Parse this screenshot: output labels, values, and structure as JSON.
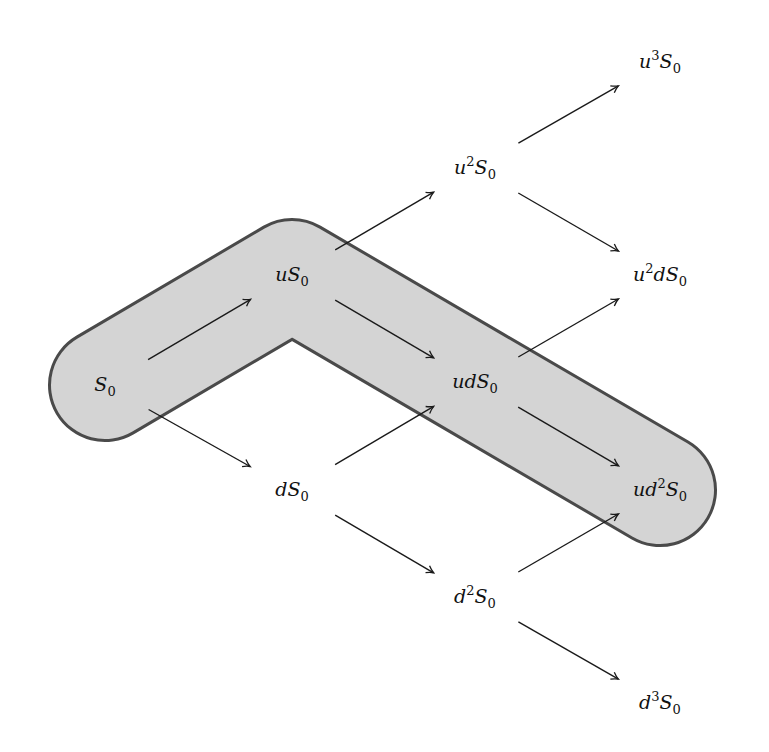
{
  "diagram": {
    "type": "binomial-tree",
    "steps": 3,
    "band": {
      "fill": "#d4d4d4",
      "stroke": "#4a4a4a",
      "path_nodes": [
        "S0",
        "uS0",
        "udS0",
        "ud2S0"
      ]
    },
    "nodes": [
      {
        "id": "S0",
        "prefix": "",
        "sup": "",
        "mid": "",
        "base": "S",
        "sub": "0",
        "x": 105,
        "y": 385
      },
      {
        "id": "uS0",
        "prefix": "u",
        "sup": "",
        "mid": "",
        "base": "S",
        "sub": "0",
        "x": 292,
        "y": 275
      },
      {
        "id": "dS0",
        "prefix": "d",
        "sup": "",
        "mid": "",
        "base": "S",
        "sub": "0",
        "x": 292,
        "y": 490
      },
      {
        "id": "u2S0",
        "prefix": "u",
        "sup": "2",
        "mid": "",
        "base": "S",
        "sub": "0",
        "x": 475,
        "y": 168
      },
      {
        "id": "udS0",
        "prefix": "ud",
        "sup": "",
        "mid": "",
        "base": "S",
        "sub": "0",
        "x": 475,
        "y": 382
      },
      {
        "id": "d2S0",
        "prefix": "d",
        "sup": "2",
        "mid": "",
        "base": "S",
        "sub": "0",
        "x": 475,
        "y": 597
      },
      {
        "id": "u3S0",
        "prefix": "u",
        "sup": "3",
        "mid": "",
        "base": "S",
        "sub": "0",
        "x": 660,
        "y": 62
      },
      {
        "id": "u2dS0",
        "prefix": "u",
        "sup": "2",
        "mid": "d",
        "base": "S",
        "sub": "0",
        "x": 660,
        "y": 275
      },
      {
        "id": "ud2S0",
        "prefix": "ud",
        "sup": "2",
        "mid": "",
        "base": "S",
        "sub": "0",
        "x": 660,
        "y": 490
      },
      {
        "id": "d3S0",
        "prefix": "d",
        "sup": "3",
        "mid": "",
        "base": "S",
        "sub": "0",
        "x": 660,
        "y": 703
      }
    ],
    "edges": [
      [
        "S0",
        "uS0"
      ],
      [
        "S0",
        "dS0"
      ],
      [
        "uS0",
        "u2S0"
      ],
      [
        "uS0",
        "udS0"
      ],
      [
        "dS0",
        "udS0"
      ],
      [
        "dS0",
        "d2S0"
      ],
      [
        "u2S0",
        "u3S0"
      ],
      [
        "u2S0",
        "u2dS0"
      ],
      [
        "udS0",
        "u2dS0"
      ],
      [
        "udS0",
        "ud2S0"
      ],
      [
        "d2S0",
        "ud2S0"
      ],
      [
        "d2S0",
        "d3S0"
      ]
    ]
  }
}
